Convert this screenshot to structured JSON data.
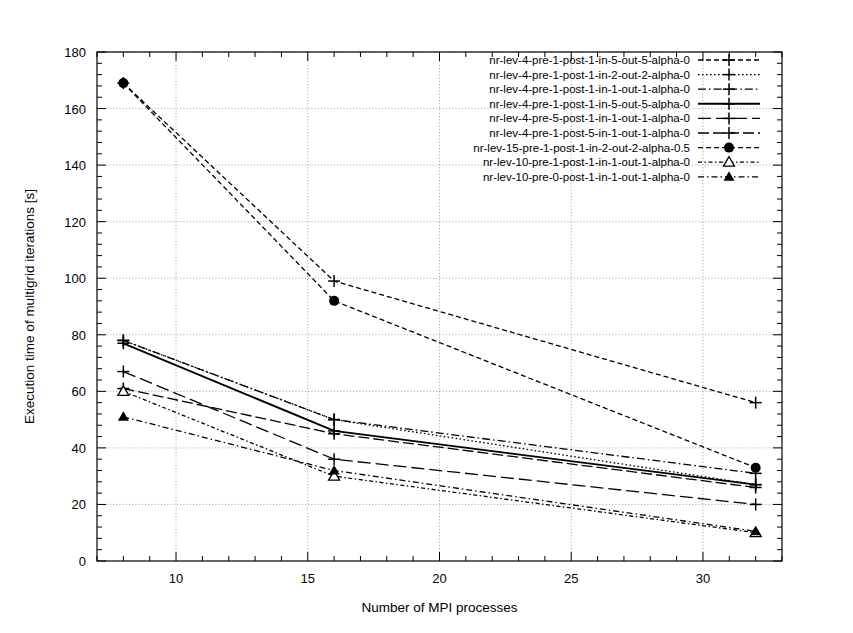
{
  "chart_data": {
    "type": "line",
    "title": "",
    "xlabel": "Number of MPI processes",
    "ylabel": "Execution time of multigrid iterations [s]",
    "xlim": [
      7,
      33
    ],
    "ylim": [
      0,
      180
    ],
    "xticks": [
      10,
      15,
      20,
      25,
      30
    ],
    "yticks": [
      0,
      20,
      40,
      60,
      80,
      100,
      120,
      140,
      160,
      180
    ],
    "grid": true,
    "legend_position": "top-right",
    "x": [
      8,
      16,
      32
    ],
    "series": [
      {
        "name": "nr-lev-4-pre-1-post-1-in-5-out-5-alpha-0",
        "values": [
          169,
          99,
          56
        ],
        "marker": "plus",
        "dash": "dotted",
        "color": "#000000"
      },
      {
        "name": "nr-lev-4-pre-1-post-1-in-2-out-2-alpha-0",
        "values": [
          78,
          50,
          27
        ],
        "marker": "plus",
        "dash": "fine-dotted",
        "color": "#000000"
      },
      {
        "name": "nr-lev-4-pre-1-post-1-in-1-out-1-alpha-0",
        "values": [
          78,
          50,
          31
        ],
        "marker": "plus",
        "dash": "dash-dot",
        "color": "#000000"
      },
      {
        "name": "nr-lev-4-pre-1-post-1-in-5-out-5-alpha-0",
        "values": [
          77,
          46,
          27
        ],
        "marker": "plus",
        "dash": "solid",
        "color": "#000000"
      },
      {
        "name": "nr-lev-4-pre-5-post-1-in-1-out-1-alpha-0",
        "values": [
          67,
          36,
          20
        ],
        "marker": "plus",
        "dash": "long-dash",
        "color": "#000000"
      },
      {
        "name": "nr-lev-4-pre-1-post-5-in-1-out-1-alpha-0",
        "values": [
          61,
          45,
          26
        ],
        "marker": "plus",
        "dash": "long-dash-2",
        "color": "#000000"
      },
      {
        "name": "nr-lev-15-pre-1-post-1-in-2-out-2-alpha-0.5",
        "values": [
          169,
          92,
          33
        ],
        "marker": "circle",
        "dash": "dotted",
        "color": "#000000"
      },
      {
        "name": "nr-lev-10-pre-1-post-1-in-1-out-1-alpha-0",
        "values": [
          60,
          30,
          10
        ],
        "marker": "triangle-open",
        "dash": "dash-dot-fine",
        "color": "#000000"
      },
      {
        "name": "nr-lev-10-pre-0-post-1-in-1-out-1-alpha-0",
        "values": [
          51,
          32,
          10.5
        ],
        "marker": "triangle-filled",
        "dash": "dash-dot-sparse",
        "color": "#000000"
      }
    ]
  }
}
